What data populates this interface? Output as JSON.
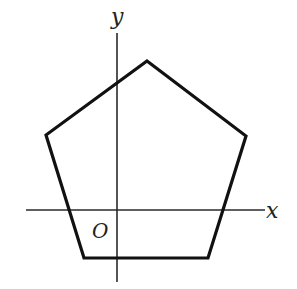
{
  "figure": {
    "type": "coordinate-diagram",
    "labels": {
      "x_axis": "x",
      "y_axis": "y",
      "origin": "O"
    },
    "colors": {
      "stroke": "#111111",
      "axis": "#2a2a2a",
      "background": "#ffffff"
    },
    "axes": {
      "x_axis": {
        "x1": 26,
        "y1": 210,
        "x2": 265,
        "y2": 210
      },
      "y_axis": {
        "x1": 117,
        "y1": 33,
        "x2": 117,
        "y2": 282
      }
    },
    "pentagon": {
      "vertices": [
        {
          "name": "top",
          "x": 147,
          "y": 61
        },
        {
          "name": "right",
          "x": 246,
          "y": 136
        },
        {
          "name": "bottom-right",
          "x": 208,
          "y": 258
        },
        {
          "name": "bottom-left",
          "x": 84,
          "y": 258
        },
        {
          "name": "left",
          "x": 46,
          "y": 135
        }
      ]
    }
  }
}
